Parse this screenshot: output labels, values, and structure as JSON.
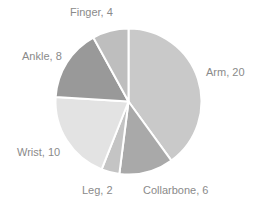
{
  "chart_data": {
    "type": "pie",
    "title": "",
    "categories": [
      "Arm",
      "Collarbone",
      "Leg",
      "Wrist",
      "Ankle",
      "Finger"
    ],
    "values": [
      20,
      6,
      2,
      10,
      8,
      4
    ],
    "colors": [
      "#c9c9c9",
      "#a9a9a9",
      "#c4c4c4",
      "#e3e3e3",
      "#999999",
      "#bebebe"
    ],
    "labels": [
      "Arm, 20",
      "Collarbone, 6",
      "Leg, 2",
      "Wrist, 10",
      "Ankle, 8",
      "Finger, 4"
    ],
    "start_angle_deg": 0,
    "direction": "clockwise",
    "legend": "none",
    "data_labels": "category, value"
  },
  "label_positions": [
    {
      "x": 206,
      "y": 66
    },
    {
      "x": 143,
      "y": 184
    },
    {
      "x": 82,
      "y": 184
    },
    {
      "x": 17,
      "y": 146
    },
    {
      "x": 22,
      "y": 50
    },
    {
      "x": 70,
      "y": 6
    }
  ]
}
